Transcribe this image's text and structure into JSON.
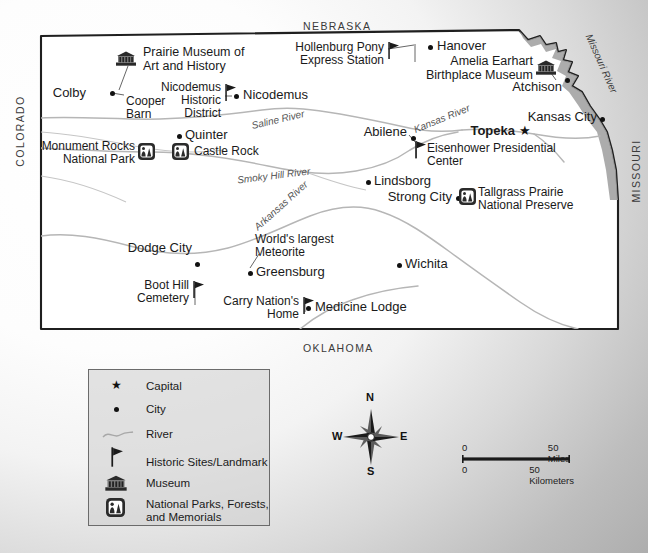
{
  "map": {
    "title": "Kansas Historic Sites and Landmarks Map",
    "neighbor_states": [
      {
        "name": "NEBRASKA",
        "position": "top"
      },
      {
        "name": "COLORADO",
        "position": "left"
      },
      {
        "name": "MISSOURI",
        "position": "right"
      },
      {
        "name": "OKLAHOMA",
        "position": "bottom"
      }
    ],
    "cities": [
      {
        "label": "Colby",
        "x": 91,
        "y": 92,
        "type": "city"
      },
      {
        "label": "Nicodemus",
        "x": 243,
        "y": 94,
        "type": "city"
      },
      {
        "label": "Quinter",
        "x": 185,
        "y": 134,
        "type": "city"
      },
      {
        "label": "Hanover",
        "x": 437,
        "y": 45,
        "type": "city"
      },
      {
        "label": "Atchison",
        "x": 532,
        "y": 86,
        "type": "city"
      },
      {
        "label": "Kansas City",
        "x": 535,
        "y": 117,
        "type": "city"
      },
      {
        "label": "Abilene",
        "x": 377,
        "y": 131,
        "type": "city"
      },
      {
        "label": "Lindsborg",
        "x": 374,
        "y": 180,
        "type": "city"
      },
      {
        "label": "Strong City",
        "x": 423,
        "y": 196,
        "type": "city"
      },
      {
        "label": "Dodge City",
        "x": 203,
        "y": 247,
        "type": "city"
      },
      {
        "label": "Greensburg",
        "x": 256,
        "y": 271,
        "type": "city"
      },
      {
        "label": "Wichita",
        "x": 405,
        "y": 263,
        "type": "city"
      },
      {
        "label": "Medicine Lodge",
        "x": 315,
        "y": 306,
        "type": "city"
      }
    ],
    "capital": {
      "label": "Topeka",
      "x": 466,
      "y": 130
    },
    "museums": [
      {
        "label": "Prairie Museum of\nArt and History",
        "x": 143,
        "y": 49
      },
      {
        "label": "Amelia Earhart\nBirthplace Museum",
        "x": 440,
        "y": 58
      }
    ],
    "historic_sites": [
      {
        "label": "Nicodemus\nHistoric\nDistrict",
        "x": 168,
        "y": 84
      },
      {
        "label": "Hollenburg Pony\nExpress Station",
        "x": 322,
        "y": 44
      },
      {
        "label": "Eisenhower Presidential\nCenter",
        "x": 426,
        "y": 145
      },
      {
        "label": "Boot Hill\nCemetery",
        "x": 148,
        "y": 278
      },
      {
        "label": "Carry Nation's\nHome",
        "x": 228,
        "y": 294
      },
      {
        "label": "Cooper\nBarn",
        "x": 132,
        "y": 98
      },
      {
        "label": "World's largest\nMeteorite",
        "x": 255,
        "y": 236
      }
    ],
    "parks": [
      {
        "label": "Monument Rocks\nNational Park",
        "x": 57,
        "y": 142
      },
      {
        "label": "Castle Rock",
        "x": 194,
        "y": 145
      },
      {
        "label": "Tallgrass Prairie\nNational Preserve",
        "x": 477,
        "y": 189
      }
    ],
    "rivers": [
      {
        "name": "Saline River",
        "x": 251,
        "y": 114,
        "rotate": -13
      },
      {
        "name": "Smoky  Hill  River",
        "x": 237,
        "y": 170,
        "rotate": -7
      },
      {
        "name": "Kansas River",
        "x": 412,
        "y": 113,
        "rotate": -22
      },
      {
        "name": "Arkansas River",
        "x": 247,
        "y": 200,
        "rotate": -42
      },
      {
        "name": "Missouri River",
        "x": 576,
        "y": 62,
        "rotate": 65
      }
    ]
  },
  "legend": {
    "items": [
      {
        "symbol": "star",
        "label": "Capital"
      },
      {
        "symbol": "dot",
        "label": "City"
      },
      {
        "symbol": "river",
        "label": "River"
      },
      {
        "symbol": "flag",
        "label": "Historic Sites/Landmark"
      },
      {
        "symbol": "museum",
        "label": "Museum"
      },
      {
        "symbol": "park",
        "label": "National Parks, Forests,\nand Memorials"
      }
    ]
  },
  "compass": {
    "north": "N",
    "south": "S",
    "east": "E",
    "west": "W"
  },
  "scalebar": {
    "miles_zero": "0",
    "miles_max": "50 Miles",
    "km_zero": "0",
    "km_max": "50 Kilometers"
  },
  "colors": {
    "border": "#1f1f1f",
    "river": "#b0b0b0",
    "land": "#ffffff",
    "text": "#1a1a1a",
    "legend_bg": "#cdcdcd"
  }
}
